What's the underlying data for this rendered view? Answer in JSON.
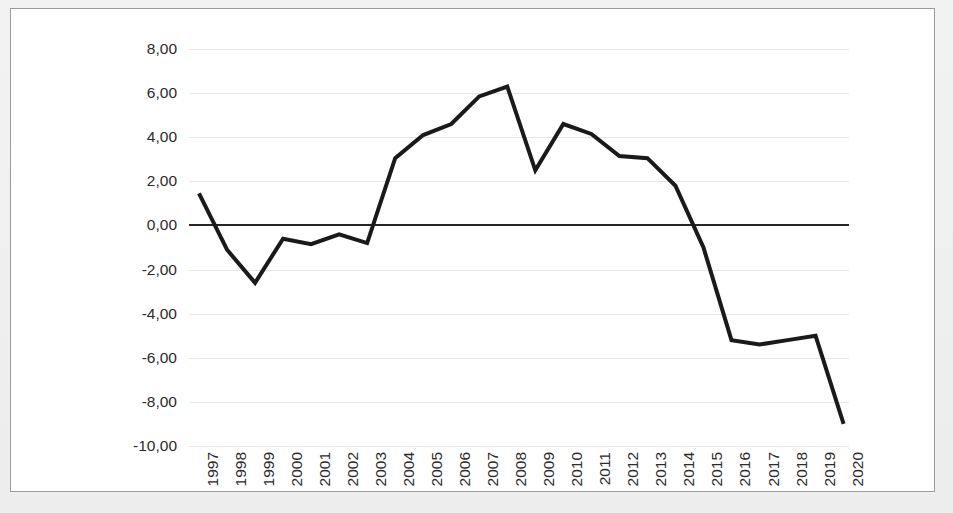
{
  "chart_data": {
    "type": "line",
    "title": "",
    "subtitle": "",
    "xlabel": "",
    "ylabel": "",
    "legend": [],
    "legend_position": "none",
    "grid": true,
    "grid_axis": "y",
    "ylim": [
      -10.0,
      8.0
    ],
    "ytick_step": 2.0,
    "decimal_separator": ",",
    "y_tick_labels": [
      "8,00",
      "6,00",
      "4,00",
      "2,00",
      "0,00",
      "-2,00",
      "-4,00",
      "-6,00",
      "-8,00",
      "-10,00"
    ],
    "y_tick_values": [
      8.0,
      6.0,
      4.0,
      2.0,
      0.0,
      -2.0,
      -4.0,
      -6.0,
      -8.0,
      -10.0
    ],
    "zero_line": 0.0,
    "x_tick_rotation": -90,
    "categories": [
      "1997",
      "1998",
      "1999",
      "2000",
      "2001",
      "2002",
      "2003",
      "2004",
      "2005",
      "2006",
      "2007",
      "2008",
      "2009",
      "2010",
      "2011",
      "2012",
      "2013",
      "2014",
      "2015",
      "2016",
      "2017",
      "2018",
      "2019",
      "2020"
    ],
    "series": [
      {
        "name": "series-1",
        "color": "#1a1a1a",
        "line_width": 4,
        "markers": false,
        "values": [
          1.45,
          -1.1,
          -2.6,
          -0.6,
          -0.85,
          -0.4,
          -0.8,
          3.05,
          4.1,
          4.6,
          5.85,
          6.3,
          2.5,
          4.6,
          4.15,
          3.15,
          3.05,
          1.8,
          -1.0,
          -5.2,
          -5.4,
          -5.2,
          -5.0,
          -9.0
        ]
      }
    ]
  },
  "style": {
    "frame_border_color": "#9a9a9a",
    "plot_background": "#ffffff",
    "gridline_color": "#e6e6e6",
    "zero_line_color": "#262626",
    "tick_label_color": "#2b2b2b",
    "line_color": "#1a1a1a"
  }
}
